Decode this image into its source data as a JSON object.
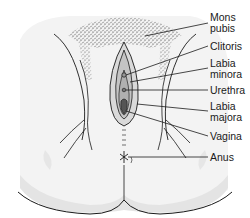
{
  "diagram": {
    "type": "anatomical-illustration",
    "colors": {
      "background": "#ffffff",
      "skin": "#f2f2f2",
      "shadow": "#e2e2e2",
      "line": "#1a1a1a",
      "text": "#1a1a1a"
    },
    "labels": [
      {
        "id": "mons-pubis",
        "lines": [
          "Mons",
          "pubis"
        ],
        "top": 12,
        "anchor": [
          145,
          36
        ],
        "line_end": [
          208,
          23
        ]
      },
      {
        "id": "clitoris",
        "lines": [
          "Clitoris"
        ],
        "top": 41,
        "anchor": [
          126,
          75
        ],
        "line_end": [
          208,
          46
        ]
      },
      {
        "id": "labia-minora",
        "lines": [
          "Labia",
          "minora"
        ],
        "top": 58,
        "anchor": [
          130,
          82
        ],
        "line_end": [
          208,
          68
        ]
      },
      {
        "id": "urethra",
        "lines": [
          "Urethra"
        ],
        "top": 85,
        "anchor": [
          126,
          90
        ],
        "line_end": [
          208,
          90
        ]
      },
      {
        "id": "labia-majora",
        "lines": [
          "Labia",
          "majora"
        ],
        "top": 101,
        "anchor": [
          137,
          104
        ],
        "line_end": [
          208,
          111
        ]
      },
      {
        "id": "vagina",
        "lines": [
          "Vagina"
        ],
        "top": 131,
        "anchor": [
          126,
          111
        ],
        "line_end": [
          208,
          136
        ]
      },
      {
        "id": "anus",
        "lines": [
          "Anus"
        ],
        "top": 152,
        "anchor": [
          123,
          157
        ],
        "line_end": [
          208,
          157
        ]
      }
    ]
  }
}
